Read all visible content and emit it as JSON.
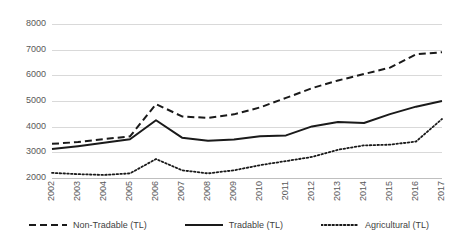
{
  "chart_data": {
    "type": "line",
    "title": "",
    "xlabel": "",
    "ylabel": "",
    "x": [
      "2002",
      "2003",
      "2004",
      "2005",
      "2006",
      "2007",
      "2008",
      "2009",
      "2010",
      "2011",
      "2012",
      "2013",
      "2014",
      "2015",
      "2016",
      "2017"
    ],
    "categories": [
      "2002",
      "2003",
      "2004",
      "2005",
      "2006",
      "2007",
      "2008",
      "2009",
      "2010",
      "2011",
      "2012",
      "2013",
      "2014",
      "2015",
      "2016",
      "2017"
    ],
    "ylim": [
      2000,
      8000
    ],
    "yticks": [
      2000,
      3000,
      4000,
      5000,
      6000,
      7000,
      8000
    ],
    "ytick_labels": [
      "2000",
      "3000",
      "4000",
      "5000",
      "6000",
      "7000",
      "8000"
    ],
    "grid": true,
    "legend_position": "bottom",
    "series": [
      {
        "name": "Non-Tradable (TL)",
        "style": "dashed",
        "color": "#1a1a1a",
        "values": [
          3330,
          3400,
          3520,
          3620,
          4880,
          4400,
          4340,
          4480,
          4750,
          5120,
          5500,
          5800,
          6050,
          6300,
          6820,
          6900
        ]
      },
      {
        "name": "Tradable (TL)",
        "style": "solid",
        "color": "#1a1a1a",
        "values": [
          3130,
          3240,
          3370,
          3510,
          4250,
          3570,
          3450,
          3500,
          3630,
          3660,
          4010,
          4180,
          4140,
          4490,
          4780,
          5000
        ]
      },
      {
        "name": "Agricultural (TL)",
        "style": "dotted",
        "color": "#1a1a1a",
        "values": [
          2200,
          2150,
          2120,
          2180,
          2740,
          2300,
          2180,
          2300,
          2500,
          2660,
          2820,
          3100,
          3270,
          3300,
          3420,
          4300
        ]
      }
    ]
  },
  "legend": {
    "items": [
      {
        "label": "Non-Tradable (TL)",
        "style": "dashed"
      },
      {
        "label": "Tradable (TL)",
        "style": "solid"
      },
      {
        "label": "Agricultural (TL)",
        "style": "dotted"
      }
    ]
  }
}
